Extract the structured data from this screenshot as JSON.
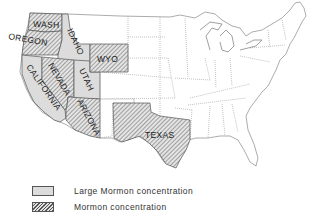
{
  "map": {
    "title": "",
    "colors": {
      "large_concentration_fill": "#dcdcdc",
      "concentration_hatch": "#555555",
      "border": "#666666",
      "background": "#ffffff"
    },
    "states": {
      "washington": {
        "label": "WASH",
        "category": "Mormon concentration"
      },
      "oregon": {
        "label": "OREGON",
        "category": "Mormon concentration"
      },
      "idaho": {
        "label": "IDAHO",
        "category": "Large Mormon concentration"
      },
      "california": {
        "label": "CALIFORNIA",
        "category": "Large Mormon concentration"
      },
      "nevada": {
        "label": "NEVADA",
        "category": "Mormon concentration"
      },
      "utah": {
        "label": "UTAH",
        "category": "Large Mormon concentration"
      },
      "arizona": {
        "label": "ARIZONA",
        "category": "Mormon concentration"
      },
      "wyoming": {
        "label": "WYO",
        "category": "Mormon concentration"
      },
      "texas": {
        "label": "TEXAS",
        "category": "Mormon concentration"
      }
    }
  },
  "legend": {
    "items": [
      {
        "label": "Large Mormon concentration",
        "swatch": "solid-gray"
      },
      {
        "label": "Mormon concentration",
        "swatch": "hatched"
      }
    ]
  }
}
